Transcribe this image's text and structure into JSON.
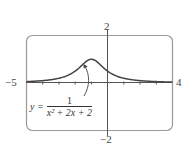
{
  "chart_data": {
    "type": "line",
    "title": "",
    "function": "y = 1/(x^2 + 2x + 2)",
    "xlim": [
      -5,
      4
    ],
    "ylim": [
      -2,
      2
    ],
    "x_tick_labels": {
      "left": "−5",
      "right": "4"
    },
    "y_tick_labels": {
      "top": "2",
      "bottom": "−2"
    },
    "grid": false,
    "series": [
      {
        "name": "y = 1/(x^2+2x+2)",
        "x": [
          -5,
          -4,
          -3,
          -2.5,
          -2,
          -1.5,
          -1,
          -0.5,
          0,
          0.5,
          1,
          2,
          3,
          4
        ],
        "values": [
          0.059,
          0.1,
          0.2,
          0.308,
          0.5,
          0.8,
          1.0,
          0.8,
          0.5,
          0.308,
          0.2,
          0.1,
          0.059,
          0.038
        ]
      }
    ],
    "annotation": {
      "lhs": "y =",
      "numerator": "1",
      "denominator": "x² + 2x + 2",
      "arrow_points_to": [
        -1.5,
        0.8
      ]
    }
  },
  "labels": {
    "x_min": "−5",
    "x_max": "4",
    "y_max": "2",
    "y_min": "−2"
  }
}
